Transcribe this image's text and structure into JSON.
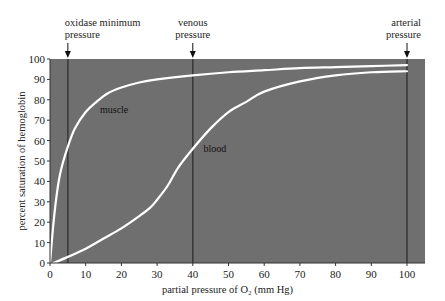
{
  "chart_data": {
    "type": "line",
    "title": "",
    "xlabel": "partial pressure of O₂ (mm Hg)",
    "ylabel": "percent saturation of hemoglobin",
    "xlim": [
      0,
      100
    ],
    "ylim": [
      0,
      100
    ],
    "xticks": [
      0,
      10,
      20,
      30,
      40,
      50,
      60,
      70,
      80,
      90,
      100
    ],
    "yticks": [
      0,
      10,
      20,
      30,
      40,
      50,
      60,
      70,
      80,
      90,
      100
    ],
    "grid": false,
    "legend": "none (inline curve labels)",
    "background_color": "#6f6f6f",
    "series": [
      {
        "name": "muscle",
        "color": "#ffffff",
        "x": [
          0,
          1,
          2,
          3,
          5,
          7,
          10,
          13,
          16,
          20,
          25,
          30,
          40,
          50,
          60,
          70,
          80,
          90,
          100
        ],
        "y": [
          0,
          20,
          35,
          45,
          57,
          66,
          74,
          79,
          83,
          86,
          88.5,
          90,
          92,
          93.5,
          94.5,
          95.5,
          96,
          96.5,
          97
        ]
      },
      {
        "name": "blood",
        "color": "#ffffff",
        "x": [
          1,
          5,
          10,
          15,
          20,
          25,
          28,
          30,
          33,
          36,
          40,
          45,
          50,
          55,
          60,
          70,
          80,
          90,
          100
        ],
        "y": [
          0,
          3,
          7,
          12,
          17,
          23,
          27,
          31,
          38,
          47,
          56,
          66,
          74,
          79,
          84,
          89,
          92,
          93.5,
          94
        ]
      }
    ],
    "annotations": [
      {
        "label_lines": [
          "oxidase minimum",
          "pressure"
        ],
        "x": 5
      },
      {
        "label_lines": [
          "venous",
          "pressure"
        ],
        "x": 40
      },
      {
        "label_lines": [
          "arterial",
          "pressure"
        ],
        "x": 100
      }
    ],
    "curve_labels": [
      {
        "text": "muscle",
        "x": 14,
        "y": 75
      },
      {
        "text": "blood",
        "x": 43,
        "y": 56
      }
    ]
  }
}
